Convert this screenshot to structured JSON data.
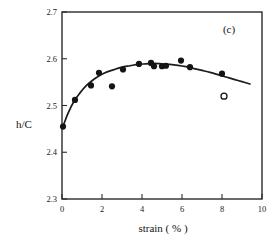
{
  "chart_data": {
    "type": "scatter",
    "title": "",
    "panel_label": "(c)",
    "xlabel": "strain ( % )",
    "ylabel": "h/C",
    "xlim": [
      0,
      10
    ],
    "ylim": [
      2.3,
      2.7
    ],
    "xticks": [
      0,
      2,
      4,
      6,
      8,
      10
    ],
    "xtick_labels": [
      "0",
      "2",
      "4",
      "6",
      "8",
      "10"
    ],
    "yticks": [
      2.3,
      2.4,
      2.5,
      2.6,
      2.7
    ],
    "ytick_labels": [
      "2.3",
      "2.4",
      "2.5",
      "2.6",
      "2.7"
    ],
    "grid": false,
    "legend": null,
    "series": [
      {
        "name": "measured",
        "marker": "filled-circle",
        "color": "#141414",
        "points": [
          {
            "x": 0.05,
            "y": 2.455
          },
          {
            "x": 0.65,
            "y": 2.512
          },
          {
            "x": 1.45,
            "y": 2.543
          },
          {
            "x": 1.85,
            "y": 2.57
          },
          {
            "x": 2.5,
            "y": 2.541
          },
          {
            "x": 3.05,
            "y": 2.577
          },
          {
            "x": 3.85,
            "y": 2.589
          },
          {
            "x": 4.45,
            "y": 2.591
          },
          {
            "x": 4.6,
            "y": 2.584
          },
          {
            "x": 5.0,
            "y": 2.584
          },
          {
            "x": 5.2,
            "y": 2.585
          },
          {
            "x": 5.95,
            "y": 2.596
          },
          {
            "x": 6.4,
            "y": 2.582
          },
          {
            "x": 8.0,
            "y": 2.568
          }
        ]
      },
      {
        "name": "excluded",
        "marker": "open-circle",
        "color": "#141414",
        "points": [
          {
            "x": 8.1,
            "y": 2.52
          }
        ]
      }
    ],
    "fit_curve": {
      "name": "fitted curve",
      "color": "#1c1c1c",
      "points": [
        {
          "x": 0.05,
          "y": 2.455
        },
        {
          "x": 0.3,
          "y": 2.483
        },
        {
          "x": 0.6,
          "y": 2.509
        },
        {
          "x": 0.9,
          "y": 2.527
        },
        {
          "x": 1.2,
          "y": 2.542
        },
        {
          "x": 1.5,
          "y": 2.553
        },
        {
          "x": 1.8,
          "y": 2.562
        },
        {
          "x": 2.1,
          "y": 2.569
        },
        {
          "x": 2.4,
          "y": 2.574
        },
        {
          "x": 2.7,
          "y": 2.578
        },
        {
          "x": 3.0,
          "y": 2.582
        },
        {
          "x": 3.4,
          "y": 2.585
        },
        {
          "x": 3.8,
          "y": 2.588
        },
        {
          "x": 4.2,
          "y": 2.589
        },
        {
          "x": 4.6,
          "y": 2.59
        },
        {
          "x": 5.0,
          "y": 2.589
        },
        {
          "x": 5.4,
          "y": 2.588
        },
        {
          "x": 5.8,
          "y": 2.586
        },
        {
          "x": 6.2,
          "y": 2.583
        },
        {
          "x": 6.6,
          "y": 2.579
        },
        {
          "x": 7.0,
          "y": 2.575
        },
        {
          "x": 7.4,
          "y": 2.571
        },
        {
          "x": 7.8,
          "y": 2.566
        },
        {
          "x": 8.2,
          "y": 2.561
        },
        {
          "x": 8.6,
          "y": 2.556
        },
        {
          "x": 9.0,
          "y": 2.551
        },
        {
          "x": 9.4,
          "y": 2.546
        }
      ]
    }
  }
}
